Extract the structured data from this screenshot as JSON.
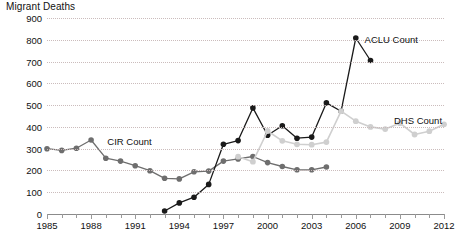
{
  "chart_data": {
    "type": "line",
    "title": "Migrant Deaths",
    "xlabel": "",
    "ylabel": "Migrant Deaths",
    "ylim": [
      0,
      900
    ],
    "xlim": [
      1985,
      2012
    ],
    "ytick_step": 100,
    "yticks": [
      "0",
      "100",
      "200",
      "300",
      "400",
      "500",
      "600",
      "700",
      "800",
      "900"
    ],
    "xticks": [
      "1985",
      "1988",
      "1991",
      "1994",
      "1997",
      "2000",
      "2003",
      "2006",
      "2009",
      "2012"
    ],
    "xtick_all_years": [
      1985,
      1986,
      1987,
      1988,
      1989,
      1990,
      1991,
      1992,
      1993,
      1994,
      1995,
      1996,
      1997,
      1998,
      1999,
      2000,
      2001,
      2002,
      2003,
      2004,
      2005,
      2006,
      2007,
      2008,
      2009,
      2010,
      2011,
      2012
    ],
    "grid": "horizontal-dotted",
    "legend": "inline-labels",
    "colors": {
      "cir": "#6e6e6e",
      "aclu": "#1a1a1a",
      "dhs": "#cfcfcf",
      "gridline": "#c9b9b9",
      "axis": "#8b8b8b",
      "text": "#111111"
    },
    "series": [
      {
        "name": "CIR Count",
        "color": "#6e6e6e",
        "label_x": 1989.1,
        "label_y": 330,
        "x": [
          1985,
          1986,
          1987,
          1988,
          1989,
          1990,
          1991,
          1992,
          1993,
          1994,
          1995,
          1996,
          1997,
          1998,
          1999,
          2000,
          2001,
          2002,
          2003,
          2004
        ],
        "values": [
          300,
          292,
          302,
          340,
          256,
          243,
          222,
          199,
          164,
          161,
          194,
          197,
          243,
          253,
          264,
          236,
          218,
          203,
          203,
          216
        ]
      },
      {
        "name": "ACLU Count",
        "color": "#1a1a1a",
        "label_x": 2006.6,
        "label_y": 800,
        "x": [
          1993,
          1994,
          1995,
          1996,
          1997,
          1998,
          1999,
          2000,
          2001,
          2002,
          2003,
          2004,
          2005,
          2006,
          2007
        ],
        "values": [
          14,
          51,
          77,
          136,
          320,
          337,
          487,
          362,
          405,
          348,
          353,
          510,
          472,
          808,
          705
        ]
      },
      {
        "name": "DHS Count",
        "color": "#cfcfcf",
        "label_x": 2008.6,
        "label_y": 425,
        "x": [
          1998,
          1999,
          2000,
          2001,
          2002,
          2003,
          2004,
          2005,
          2006,
          2007,
          2008,
          2009,
          2010,
          2011,
          2012
        ],
        "values": [
          263,
          240,
          381,
          336,
          320,
          318,
          330,
          472,
          426,
          400,
          390,
          417,
          365,
          380,
          412
        ]
      }
    ]
  }
}
